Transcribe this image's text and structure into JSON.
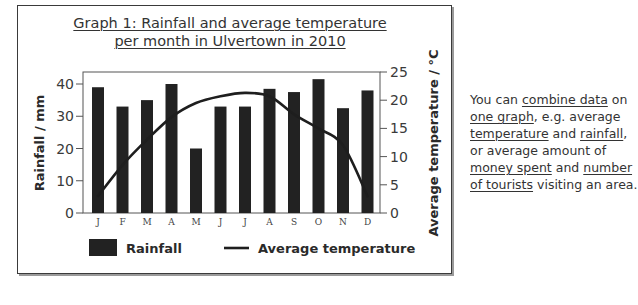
{
  "figure": {
    "title_line1": "Graph 1: Rainfall and average temperature",
    "title_line2": "per month in Ulvertown in 2010"
  },
  "side_text": {
    "segments": [
      {
        "t": "You can ",
        "u": false
      },
      {
        "t": "combine data",
        "u": true
      },
      {
        "t": " on ",
        "u": false
      },
      {
        "t": "one graph",
        "u": true
      },
      {
        "t": ", e.g. average ",
        "u": false
      },
      {
        "t": "temperature",
        "u": true
      },
      {
        "t": " and ",
        "u": false
      },
      {
        "t": "rainfall",
        "u": true
      },
      {
        "t": ", or average amount of ",
        "u": false
      },
      {
        "t": "money spent",
        "u": true
      },
      {
        "t": " and ",
        "u": false
      },
      {
        "t": "number of tourists",
        "u": true
      },
      {
        "t": " visiting an area.",
        "u": false
      }
    ]
  },
  "colors": {
    "bar": "#222222",
    "line": "#1e1e1e",
    "axis": "#3a3a3a"
  },
  "chart_data": {
    "type": "bar+line",
    "title": "Graph 1: Rainfall and average temperature per month in Ulvertown in 2010",
    "categories": [
      "J",
      "F",
      "M",
      "A",
      "M",
      "J",
      "J",
      "A",
      "S",
      "O",
      "N",
      "D"
    ],
    "series": [
      {
        "name": "Rainfall",
        "type": "bar",
        "axis": "left",
        "unit": "mm",
        "values": [
          39,
          33,
          35,
          40,
          20,
          33,
          33,
          38.5,
          37.5,
          41.5,
          32.5,
          38
        ]
      },
      {
        "name": "Average temperature",
        "type": "line",
        "axis": "right",
        "unit": "°C",
        "values": [
          3,
          8.5,
          13,
          17,
          19.5,
          20.7,
          21.3,
          20.7,
          17.5,
          15,
          12,
          3
        ]
      }
    ],
    "ylabel": "Rainfall / mm",
    "ylim": [
      0,
      43.5
    ],
    "yticks": [
      0,
      10,
      20,
      30,
      40
    ],
    "y2label": "Average temperature / °C",
    "y2lim": [
      0,
      25
    ],
    "y2ticks": [
      0,
      5,
      10,
      15,
      20,
      25
    ],
    "xlabel": "",
    "grid": false,
    "legend": {
      "position": "bottom",
      "entries": [
        "Rainfall",
        "Average temperature"
      ]
    }
  }
}
